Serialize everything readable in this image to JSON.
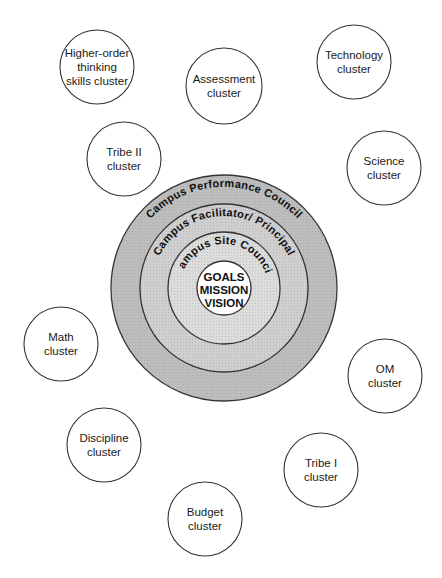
{
  "diagram": {
    "center": {
      "x": 224,
      "y": 288
    },
    "rings": [
      {
        "label": "Campus Performance Council",
        "radius": 113,
        "fill": "#bdbdbd",
        "text_radius": 101
      },
      {
        "label": "Campus Facilitator/ Principal",
        "radius": 84,
        "fill": "#cfcfcf",
        "text_radius": 72
      },
      {
        "label": "Campus Site Council",
        "radius": 56,
        "fill": "#dcdcdc",
        "text_radius": 44
      }
    ],
    "core": {
      "radius": 27,
      "fill": "#ffffff",
      "lines": [
        "GOALS",
        "MISSION",
        "VISION"
      ]
    },
    "clusters": [
      {
        "id": "higher-order-thinking",
        "lines": [
          "Higher-order",
          "thinking",
          "skills cluster"
        ],
        "cx": 97,
        "cy": 67,
        "r": 37
      },
      {
        "id": "assessment",
        "lines": [
          "Assessment",
          "cluster"
        ],
        "cx": 224,
        "cy": 86,
        "r": 38
      },
      {
        "id": "technology",
        "lines": [
          "Technology",
          "cluster"
        ],
        "cx": 354,
        "cy": 62,
        "r": 37
      },
      {
        "id": "tribe-ii",
        "lines": [
          "Tribe II",
          "cluster"
        ],
        "cx": 124,
        "cy": 159,
        "r": 37
      },
      {
        "id": "science",
        "lines": [
          "Science",
          "cluster"
        ],
        "cx": 384,
        "cy": 168,
        "r": 37
      },
      {
        "id": "math",
        "lines": [
          "Math",
          "cluster"
        ],
        "cx": 61,
        "cy": 344,
        "r": 37
      },
      {
        "id": "om",
        "lines": [
          "OM",
          "cluster"
        ],
        "cx": 385,
        "cy": 376,
        "r": 37
      },
      {
        "id": "discipline",
        "lines": [
          "Discipline",
          "cluster"
        ],
        "cx": 104,
        "cy": 445,
        "r": 37
      },
      {
        "id": "tribe-i",
        "lines": [
          "Tribe I",
          "cluster"
        ],
        "cx": 321,
        "cy": 470,
        "r": 37
      },
      {
        "id": "budget",
        "lines": [
          "Budget",
          "cluster"
        ],
        "cx": 205,
        "cy": 519,
        "r": 37
      }
    ],
    "stroke_color": "#333333"
  }
}
